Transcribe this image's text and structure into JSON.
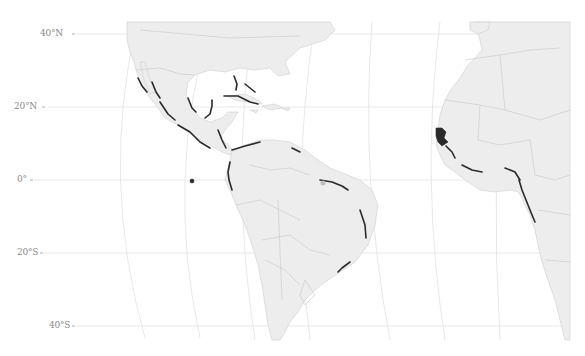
{
  "map": {
    "type": "species distribution map",
    "region": "Tropical Atlantic: Americas and West Africa",
    "colors": {
      "background": "#ffffff",
      "land": "#ededed",
      "land_border": "#c8c8c8",
      "graticule": "#e2e2e2",
      "occurrence": "#2a2a2a",
      "label": "#8a8a8a"
    },
    "latitude_labels": [
      {
        "label": "40°N",
        "lat": 40,
        "y": 34
      },
      {
        "label": "20°N",
        "lat": 20,
        "y": 107
      },
      {
        "label": "0°",
        "lat": 0,
        "y": 180
      },
      {
        "label": "20°S",
        "lat": -20,
        "y": 253
      },
      {
        "label": "40°S",
        "lat": -40,
        "y": 326
      }
    ],
    "occurrence_regions": [
      "Pacific coast of Mexico",
      "Gulf of Mexico coast",
      "Florida",
      "Cuba and Bahamas",
      "Yucatán Peninsula",
      "Caribbean coast of Central America",
      "Pacific coast of Central America",
      "Caribbean coast of South America",
      "Ecuador / Colombia Pacific coast",
      "Galápagos Islands",
      "Guianas and northern Brazil coast",
      "Eastern Brazil coast",
      "Senegal / Guinea-Bissau / Guinea",
      "Gulf of Guinea coast",
      "Gabon / Congo / Angola coast"
    ]
  }
}
